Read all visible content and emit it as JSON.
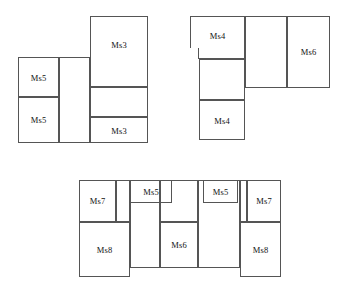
{
  "diagram": {
    "stroke_color": "#555555",
    "background_color": "#ffffff",
    "label_color": "#111111",
    "groups": [
      {
        "id": "group-top-left",
        "name": "top-left-assembly",
        "cells": [
          {
            "name": "cell-ms5-upper-left",
            "label": "Ms5",
            "x": 18,
            "y": 57,
            "w": 41,
            "h": 40,
            "label_dy": 15
          },
          {
            "name": "cell-ms5-lower-left",
            "label": "Ms5",
            "x": 18,
            "y": 97,
            "w": 41,
            "h": 46,
            "label_dy": 17
          },
          {
            "name": "cell-blank-middle",
            "label": "",
            "x": 59,
            "y": 57,
            "w": 31,
            "h": 86,
            "label_dy": 38
          },
          {
            "name": "cell-ms3-upper",
            "label": "Ms3",
            "x": 90,
            "y": 16,
            "w": 58,
            "h": 71,
            "label_dy": 23
          },
          {
            "name": "cell-blank-ms3-middle",
            "label": "",
            "x": 90,
            "y": 87,
            "w": 58,
            "h": 30,
            "label_dy": 10
          },
          {
            "name": "cell-ms3-lower",
            "label": "Ms3",
            "x": 90,
            "y": 117,
            "w": 58,
            "h": 26,
            "label_dy": 8
          }
        ]
      },
      {
        "id": "group-top-right",
        "name": "top-right-assembly",
        "cells": [
          {
            "name": "cell-ms4-upper",
            "label": "Ms4",
            "x": 190,
            "y": 16,
            "w": 55,
            "h": 43,
            "label_dy": 14
          },
          {
            "name": "cell-blank-ms4-middle",
            "label": "",
            "x": 199,
            "y": 59,
            "w": 46,
            "h": 41,
            "label_dy": 16
          },
          {
            "name": "cell-ms4-lower",
            "label": "Ms4",
            "x": 199,
            "y": 100,
            "w": 46,
            "h": 40,
            "label_dy": 15
          },
          {
            "name": "cell-blank-center-right",
            "label": "",
            "x": 245,
            "y": 16,
            "w": 42,
            "h": 72,
            "label_dy": 31
          },
          {
            "name": "cell-ms6-right",
            "label": "Ms6",
            "x": 287,
            "y": 16,
            "w": 43,
            "h": 72,
            "label_dy": 30
          }
        ],
        "notch": {
          "name": "notch-step-left",
          "x": 190,
          "y": 48,
          "w": 9,
          "h": 11
        }
      },
      {
        "id": "group-bottom",
        "name": "bottom-assembly",
        "cells": [
          {
            "name": "cell-ms7-left",
            "label": "Ms7",
            "x": 79,
            "y": 180,
            "w": 37,
            "h": 42,
            "label_dy": 15
          },
          {
            "name": "cell-blank-left-strip",
            "label": "",
            "x": 116,
            "y": 180,
            "w": 14,
            "h": 42,
            "label_dy": 16
          },
          {
            "name": "cell-ms8-left",
            "label": "Ms8",
            "x": 79,
            "y": 222,
            "w": 51,
            "h": 55,
            "label_dy": 22
          },
          {
            "name": "cell-blank-col2",
            "label": "",
            "x": 130,
            "y": 180,
            "w": 30,
            "h": 88,
            "label_dy": 39
          },
          {
            "name": "cell-ms5-left-mid",
            "label": "Ms5",
            "x": 130,
            "y": 180,
            "w": 42,
            "h": 23,
            "label_dy": 6
          },
          {
            "name": "cell-blank-col3-top",
            "label": "",
            "x": 160,
            "y": 180,
            "w": 38,
            "h": 42,
            "label_dy": 16
          },
          {
            "name": "cell-ms6-bottom",
            "label": "Ms6",
            "x": 160,
            "y": 222,
            "w": 38,
            "h": 46,
            "label_dy": 17
          },
          {
            "name": "cell-blank-col4",
            "label": "",
            "x": 198,
            "y": 180,
            "w": 42,
            "h": 88,
            "label_dy": 39
          },
          {
            "name": "cell-ms5-right-mid",
            "label": "Ms5",
            "x": 203,
            "y": 180,
            "w": 35,
            "h": 23,
            "label_dy": 6
          },
          {
            "name": "cell-ms7-right",
            "label": "Ms7",
            "x": 247,
            "y": 180,
            "w": 34,
            "h": 42,
            "label_dy": 15
          },
          {
            "name": "cell-blank-right-strip",
            "label": "",
            "x": 240,
            "y": 180,
            "w": 7,
            "h": 42,
            "label_dy": 16
          },
          {
            "name": "cell-ms8-right",
            "label": "Ms8",
            "x": 240,
            "y": 222,
            "w": 41,
            "h": 55,
            "label_dy": 22
          }
        ]
      }
    ]
  }
}
